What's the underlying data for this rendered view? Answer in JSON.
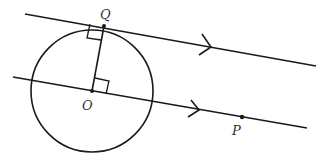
{
  "diagram": {
    "type": "geometry",
    "colors": {
      "stroke": "#1a1a1a",
      "label": "#333333",
      "background": "#ffffff"
    },
    "points": [
      {
        "id": "Q",
        "label": "Q",
        "x": 104,
        "y": 26
      },
      {
        "id": "O",
        "label": "O",
        "x": 92,
        "y": 91
      },
      {
        "id": "P",
        "label": "P",
        "x": 242,
        "y": 117
      }
    ],
    "circle": {
      "center": "O",
      "radius": 61
    },
    "lines": [
      {
        "id": "tangent-line",
        "through": "Q",
        "arrow": true,
        "parallel_to": "line-OP"
      },
      {
        "id": "line-OP",
        "through": [
          "O",
          "P"
        ],
        "arrow": true
      }
    ],
    "segments": [
      {
        "from": "O",
        "to": "Q"
      }
    ],
    "right_angles": [
      "at Q between OQ and tangent",
      "at O between OQ and line OP"
    ]
  }
}
